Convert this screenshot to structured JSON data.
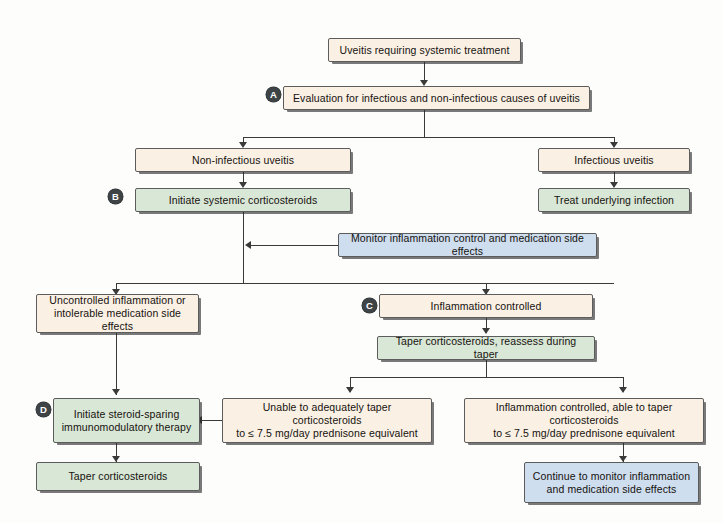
{
  "diagram": {
    "colors": {
      "cream": "#faf0e4",
      "green": "#d9e7d6",
      "blue": "#cfdeee",
      "border": "#5c5c5c",
      "connector": "#3a3a3a",
      "badge": "#3e4346",
      "page_background": "#fdfdfc"
    },
    "nodes": [
      {
        "id": "n1",
        "label": "Uveitis requiring systemic treatment",
        "color": "cream",
        "badge": null
      },
      {
        "id": "n2",
        "label": "Evaluation for infectious and non-infectious causes of uveitis",
        "color": "cream",
        "badge": "A"
      },
      {
        "id": "n3",
        "label": "Non-infectious uveitis",
        "color": "cream",
        "badge": null
      },
      {
        "id": "n4",
        "label": "Infectious uveitis",
        "color": "cream",
        "badge": null
      },
      {
        "id": "n5",
        "label": "Initiate systemic corticosteroids",
        "color": "green",
        "badge": "B"
      },
      {
        "id": "n6",
        "label": "Treat underlying infection",
        "color": "green",
        "badge": null
      },
      {
        "id": "n7",
        "label": "Monitor inflammation control and medication side effects",
        "color": "blue",
        "badge": null
      },
      {
        "id": "n8",
        "line1": "Uncontrolled inflammation or",
        "line2": "intolerable medication side effects",
        "color": "cream",
        "badge": null
      },
      {
        "id": "n9",
        "label": "Inflammation controlled",
        "color": "cream",
        "badge": "C"
      },
      {
        "id": "n10",
        "label": "Taper corticosteroids, reassess during taper",
        "color": "green",
        "badge": null
      },
      {
        "id": "n11",
        "line1": "Initiate steroid-sparing",
        "line2": "immunomodulatory therapy",
        "color": "green",
        "badge": "D"
      },
      {
        "id": "n12",
        "line1": "Unable to adequately taper corticosteroids",
        "line2": "to ≤ 7.5 mg/day prednisone equivalent",
        "color": "cream",
        "badge": null
      },
      {
        "id": "n13",
        "line1": "Inflammation controlled, able to taper corticosteroids",
        "line2": "to ≤ 7.5 mg/day prednisone equivalent",
        "color": "cream",
        "badge": null
      },
      {
        "id": "n14",
        "label": "Taper corticosteroids",
        "color": "green",
        "badge": null
      },
      {
        "id": "n15",
        "line1": "Continue to monitor inflammation",
        "line2": "and medication side effects",
        "color": "blue",
        "badge": null
      }
    ],
    "badges": {
      "a": "A",
      "b": "B",
      "c": "C",
      "d": "D"
    }
  }
}
